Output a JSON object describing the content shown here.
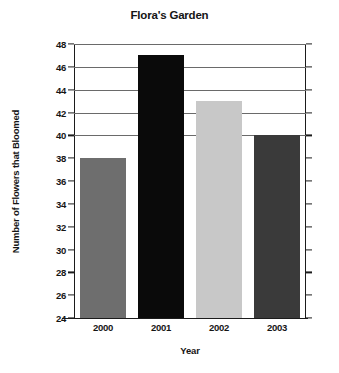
{
  "chart_data": {
    "type": "bar",
    "title": "Flora's Garden",
    "xlabel": "Year",
    "ylabel": "Number of Flowers that Bloomed",
    "categories": [
      "2000",
      "2001",
      "2002",
      "2003"
    ],
    "values": [
      38,
      47,
      43,
      40
    ],
    "ylim": [
      24,
      48
    ],
    "ytick_step": 2,
    "yticks": [
      24,
      26,
      28,
      30,
      32,
      34,
      36,
      38,
      40,
      42,
      44,
      46,
      48
    ],
    "ytick_labels": [
      "24",
      "26",
      "28",
      "30",
      "32",
      "34",
      "36",
      "38",
      "40",
      "42",
      "44",
      "46",
      "48"
    ],
    "grid": true,
    "grid_axis": "y",
    "legend": false,
    "legend_position": "none",
    "bar_colors": [
      "#6e6e6e",
      "#0a0a0a",
      "#c8c8c8",
      "#3a3a3a"
    ],
    "series": [
      {
        "name": "Number of Flowers that Bloomed",
        "values": [
          38,
          47,
          43,
          40
        ]
      }
    ],
    "points": [
      {
        "category": "2000",
        "value": 38,
        "color": "#6e6e6e"
      },
      {
        "category": "2001",
        "value": 47,
        "color": "#0a0a0a"
      },
      {
        "category": "2002",
        "value": 43,
        "color": "#c8c8c8"
      },
      {
        "category": "2003",
        "value": 40,
        "color": "#3a3a3a"
      }
    ],
    "axis_color": "#1b1b1b",
    "gridline_color": "#6a6a6a",
    "background_color": "#ffffff"
  }
}
